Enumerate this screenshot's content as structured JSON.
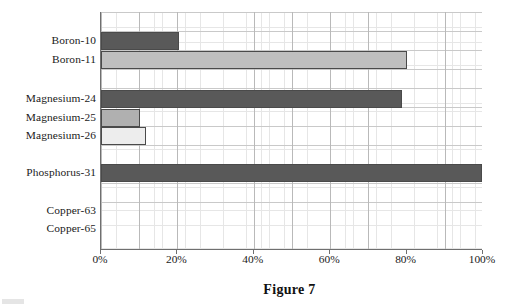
{
  "figure": {
    "caption": "Figure 7",
    "colors": {
      "dark_gray": "#595959",
      "light_gray": "#bfbfbf",
      "medium_gray": "#b0b0b0",
      "very_light_gray": "#ededed",
      "bar_border": "#4a4a4a",
      "axis": "#6f6f6f",
      "grid_minor": "#e6e6e6",
      "grid_major": "#b9b9b9"
    }
  },
  "chart_data": {
    "type": "bar",
    "orientation": "horizontal",
    "title": "Figure 7",
    "xlabel": "",
    "ylabel": "",
    "xlim": [
      0,
      100
    ],
    "grid": true,
    "legend": "none",
    "categories": [
      "Boron-10",
      "Boron-11",
      "Magnesium-24",
      "Magnesium-25",
      "Magnesium-26",
      "Phosphorus-31",
      "Copper-63",
      "Copper-65"
    ],
    "values": [
      20.4,
      80.1,
      78.8,
      10.2,
      11.8,
      99.8,
      0,
      0
    ],
    "bar_colors": [
      "#595959",
      "#bfbfbf",
      "#595959",
      "#b0b0b0",
      "#ededed",
      "#595959",
      "#ffffff",
      "#ffffff"
    ],
    "xticks": [
      0,
      20,
      40,
      60,
      80,
      100
    ],
    "xtick_labels": [
      "0%",
      "20%",
      "40%",
      "60%",
      "80%",
      "100%"
    ]
  }
}
